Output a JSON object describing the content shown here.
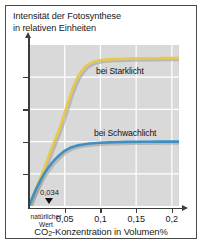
{
  "figure": {
    "title_line1": "Intensität der Fotosynthese",
    "title_line2": "in relativen Einheiten",
    "xlabel_prefix": "CO",
    "xlabel_sub": "2",
    "xlabel_suffix": "-Konzentration in Volumen%"
  },
  "annotation": {
    "value": "0,034",
    "natural_line1": "natürlicher",
    "natural_line2": "Wert"
  },
  "colors": {
    "strong_light": "#e9c84e",
    "weak_light": "#3e8fc3",
    "shadow": "#9a9a9a",
    "plot_background": "#d9d9d9",
    "gridline": "#ffffff",
    "axis": "#3c3c3c",
    "frame": "#4a4a4a"
  },
  "chart_data": {
    "type": "line",
    "title": "Intensität der Fotosynthese in relativen Einheiten",
    "xlabel": "CO2-Konzentration in Volumen%",
    "ylabel": "Intensität der Fotosynthese in relativen Einheiten",
    "xlim": [
      0,
      0.21
    ],
    "ylim": [
      0,
      1.0
    ],
    "grid": true,
    "legend_position": "inline-labels",
    "xticks": [
      0.05,
      0.1,
      0.15,
      0.2
    ],
    "xticklabels": [
      "0,05",
      "0,1",
      "0,15",
      "0,2"
    ],
    "yticks": [
      0.2,
      0.4,
      0.6,
      0.8
    ],
    "yticklabels": [
      "",
      "",
      "",
      ""
    ],
    "annotations": [
      {
        "label": "0,034",
        "sublabel": "natürlicher Wert",
        "x": 0.034,
        "y": 0
      }
    ],
    "series": [
      {
        "name": "bei Starklicht",
        "color": "#e9c84e",
        "x": [
          0.0,
          0.005,
          0.01,
          0.015,
          0.02,
          0.025,
          0.03,
          0.034,
          0.04,
          0.045,
          0.05,
          0.055,
          0.06,
          0.065,
          0.07,
          0.08,
          0.09,
          0.1,
          0.12,
          0.14,
          0.16,
          0.18,
          0.2,
          0.21
        ],
        "values": [
          0.0,
          0.055,
          0.11,
          0.165,
          0.22,
          0.28,
          0.34,
          0.385,
          0.45,
          0.51,
          0.58,
          0.65,
          0.715,
          0.77,
          0.815,
          0.87,
          0.895,
          0.905,
          0.912,
          0.915,
          0.917,
          0.918,
          0.919,
          0.919
        ]
      },
      {
        "name": "bei Schwachlicht",
        "color": "#3e8fc3",
        "x": [
          0.0,
          0.005,
          0.01,
          0.015,
          0.02,
          0.025,
          0.03,
          0.034,
          0.04,
          0.045,
          0.05,
          0.055,
          0.06,
          0.07,
          0.08,
          0.09,
          0.1,
          0.12,
          0.14,
          0.16,
          0.18,
          0.2,
          0.21
        ],
        "values": [
          0.0,
          0.055,
          0.105,
          0.15,
          0.19,
          0.225,
          0.255,
          0.278,
          0.305,
          0.325,
          0.342,
          0.355,
          0.365,
          0.378,
          0.385,
          0.39,
          0.393,
          0.396,
          0.398,
          0.399,
          0.4,
          0.4,
          0.4
        ]
      }
    ]
  }
}
